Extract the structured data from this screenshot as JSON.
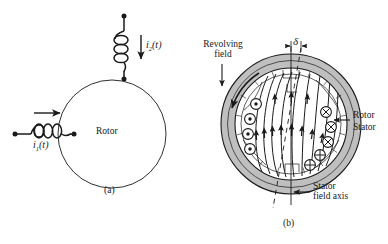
{
  "figure": {
    "panels": [
      {
        "id": "a",
        "caption": "(a)",
        "description": "Rotor circle with two coupled coils"
      },
      {
        "id": "b",
        "caption": "(b)",
        "description": "Machine cross section with revolving field"
      }
    ]
  },
  "panel_a": {
    "rotor_label": "Rotor",
    "current_1": {
      "symbol": "i",
      "subscript": "1",
      "arg": "(t)",
      "full": "i1(t)",
      "direction": "right"
    },
    "current_2": {
      "symbol": "i",
      "subscript": "2",
      "arg": "(t)",
      "full": "i2(t)",
      "direction": "down"
    },
    "caption": "(a)"
  },
  "panel_b": {
    "revolving_field_label_line1": "Revolving",
    "revolving_field_label_line2": "field",
    "rotor_label": "Rotor",
    "stator_label": "Stator",
    "stator_axis_label_line1": "Stator",
    "stator_axis_label_line2": "field axis",
    "angle_symbol": "δ",
    "caption": "(b)",
    "symbols": {
      "out_of_page": "⊙",
      "into_page_x": "⊗",
      "into_page_plus": "⊕"
    },
    "counts": {
      "dots_out_of_page": 4,
      "crosses_into_page": 3,
      "plus_into_page": 2
    }
  },
  "colors": {
    "line": "#1a1a1a",
    "stator_fill": "#bfbfbf",
    "background": "#ffffff",
    "rotor_fill": "#ffffff"
  }
}
